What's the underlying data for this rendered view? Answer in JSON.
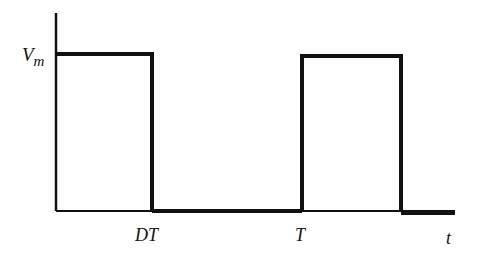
{
  "diagram": {
    "type": "square-wave waveform",
    "labels": {
      "y_level": "V",
      "y_level_sub": "m",
      "x_tick_1": "DT",
      "x_tick_2": "T",
      "x_axis": "t"
    },
    "colors": {
      "stroke": "#111111",
      "background": "#ffffff"
    },
    "waveform": [
      {
        "segment": "high",
        "from": "0",
        "to": "DT",
        "value": "Vm"
      },
      {
        "segment": "low",
        "from": "DT",
        "to": "T",
        "value": "0"
      },
      {
        "segment": "high",
        "from": "T",
        "to": "T+DT",
        "value": "Vm"
      },
      {
        "segment": "low",
        "from": "T+DT",
        "to": "end",
        "value": "0"
      }
    ]
  }
}
